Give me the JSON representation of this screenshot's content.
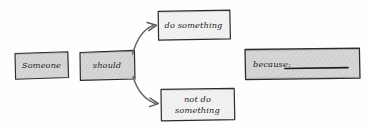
{
  "diagram": {
    "style": "hand-drawn sketch",
    "background_color": "#fefefe",
    "stroke_color": "#2b2b2b",
    "fill_gray": "#d6d6d6",
    "fill_light": "#f2f2f2",
    "nodes": [
      {
        "id": "subject",
        "label": "Someone",
        "fill": "#d6d6d6",
        "x": 14,
        "y": 52,
        "w": 55,
        "h": 27
      },
      {
        "id": "modal",
        "label": "should",
        "fill": "#d6d6d6",
        "x": 79,
        "y": 50,
        "w": 56,
        "h": 30
      },
      {
        "id": "action-positive",
        "label": "do something",
        "fill": "#f2f2f2",
        "x": 157,
        "y": 10,
        "w": 73,
        "h": 30
      },
      {
        "id": "action-negative",
        "label": "not do\nsomething",
        "fill": "#f2f2f2",
        "x": 160,
        "y": 88,
        "w": 75,
        "h": 33
      },
      {
        "id": "reason",
        "label": "because:",
        "fill": "#d6d6d6",
        "x": 244,
        "y": 48,
        "w": 116,
        "h": 32,
        "has_blank_line": true
      }
    ],
    "connectors": [
      {
        "id": "branch-up",
        "from": "modal",
        "to": "action-positive",
        "shape": "curved-arrow-up-right"
      },
      {
        "id": "branch-down",
        "from": "modal",
        "to": "action-negative",
        "shape": "curved-arrow-down-right"
      }
    ]
  }
}
